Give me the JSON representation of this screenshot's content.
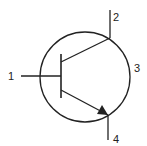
{
  "diagram": {
    "type": "npn-transistor-symbol",
    "labels": {
      "base": "1",
      "collector": "2",
      "envelope": "3",
      "emitter": "4"
    },
    "colors": {
      "stroke": "#222222",
      "background": "#ffffff"
    }
  }
}
